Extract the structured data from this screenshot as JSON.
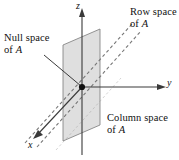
{
  "figure": {
    "name": "subspaces-of-a-3d-coordinate-system",
    "background_color": "#ffffff",
    "line_color": "#3a3a3a",
    "plane_fill": "#d9d9d9",
    "plane_stroke": "#6e6e6e",
    "dash_color": "#777777",
    "text_color": "#111111"
  },
  "axes": {
    "x": {
      "label": "x",
      "italic": true
    },
    "y": {
      "label": "y",
      "italic": true
    },
    "z": {
      "label": "z",
      "italic": true
    }
  },
  "labels": {
    "null_space": {
      "line1": "Null space",
      "line2_prefix": "of ",
      "line2_italic": "A"
    },
    "row_space": {
      "line1": "Row space",
      "line2_prefix": "of ",
      "line2_italic": "A"
    },
    "column_space": {
      "line1": "Column space",
      "line2_prefix": "of ",
      "line2_italic": "A"
    }
  },
  "origin": {
    "marker": "filled-dot"
  }
}
